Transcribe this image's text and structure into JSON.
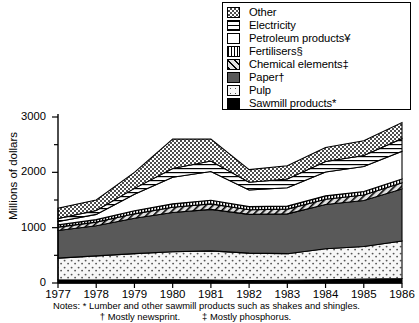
{
  "chart_data": {
    "type": "area",
    "title": "",
    "subtitle": "",
    "xlabel": "",
    "ylabel": "Millions of dollars",
    "x": [
      1977,
      1978,
      1979,
      1980,
      1981,
      1982,
      1983,
      1984,
      1985,
      1986
    ],
    "categories": [
      "1977",
      "1978",
      "1979",
      "1980",
      "1981",
      "1982",
      "1983",
      "1984",
      "1985",
      "1986"
    ],
    "xlim": [
      1977,
      1986
    ],
    "ylim": [
      0,
      3000
    ],
    "ytick_labels": [
      "0",
      "1000",
      "2000",
      "3000"
    ],
    "ytick_values": [
      0,
      1000,
      2000,
      3000
    ],
    "yminor_ticks": [
      500,
      1500,
      2500
    ],
    "grid": false,
    "stacked": true,
    "legend_position": "top-right",
    "series": [
      {
        "name": "Sawmill products*",
        "pattern": "solid-black",
        "color": "#000000",
        "values": [
          60,
          55,
          60,
          60,
          55,
          45,
          50,
          60,
          70,
          80
        ]
      },
      {
        "name": "Pulp",
        "pattern": "sparse-dots",
        "color": "#f2f2f2",
        "values": [
          390,
          435,
          470,
          505,
          525,
          495,
          480,
          560,
          590,
          680
        ]
      },
      {
        "name": "Paper†",
        "pattern": "solid-gray",
        "color": "#595959",
        "values": [
          500,
          545,
          640,
          710,
          750,
          700,
          720,
          800,
          830,
          940
        ]
      },
      {
        "name": "Chemical elements‡",
        "pattern": "diagonal-hatch",
        "color": "#d9d9d9",
        "values": [
          60,
          65,
          80,
          95,
          100,
          85,
          85,
          95,
          100,
          110
        ]
      },
      {
        "name": "Fertilisers§",
        "pattern": "vertical-lines",
        "color": "#cccccc",
        "values": [
          40,
          45,
          55,
          60,
          65,
          55,
          55,
          60,
          65,
          70
        ]
      },
      {
        "name": "Petroleum products¥",
        "pattern": "white",
        "color": "#ffffff",
        "values": [
          60,
          95,
          300,
          480,
          520,
          300,
          330,
          430,
          450,
          500
        ]
      },
      {
        "name": "Electricity",
        "pattern": "horizontal-lines",
        "color": "#ffffff",
        "values": [
          55,
          70,
          105,
          160,
          190,
          140,
          160,
          190,
          200,
          230
        ]
      },
      {
        "name": "Other",
        "pattern": "checkered",
        "color": "#bfbfbf",
        "values": [
          185,
          190,
          290,
          530,
          395,
          230,
          240,
          255,
          265,
          290
        ]
      }
    ],
    "totals": [
      1350,
      1500,
      2000,
      2600,
      2600,
      2050,
      2120,
      2450,
      2570,
      2900
    ]
  },
  "legend": {
    "items": [
      {
        "label": "Other",
        "swatch": "checkered-swatch"
      },
      {
        "label": "Electricity",
        "swatch": "horizontal-lines-swatch"
      },
      {
        "label": "Petroleum products¥",
        "swatch": "white-swatch"
      },
      {
        "label": "Fertilisers§",
        "swatch": "vertical-lines-swatch"
      },
      {
        "label": "Chemical elements‡",
        "swatch": "diagonal-hatch-swatch"
      },
      {
        "label": "Paper†",
        "swatch": "solid-gray-swatch"
      },
      {
        "label": "Pulp",
        "swatch": "sparse-dots-swatch"
      },
      {
        "label": "Sawmill products*",
        "swatch": "solid-black-swatch"
      }
    ]
  },
  "axes": {
    "y_title": "Millions of dollars",
    "y_labels": [
      "3000",
      "2000",
      "1000",
      "0"
    ],
    "x_labels": [
      "1977",
      "1978",
      "1979",
      "1980",
      "1981",
      "1982",
      "1983",
      "1984",
      "1985",
      "1986"
    ]
  },
  "notes": {
    "line1": "Notes: * Lumber and other sawmill products such as shakes and shingles.",
    "line2a": "† Mostly newsprint.",
    "line2b": "‡ Mostly phosphorus."
  }
}
